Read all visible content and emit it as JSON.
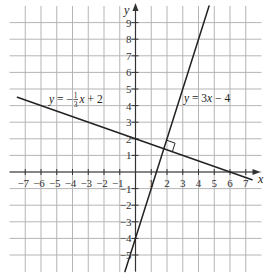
{
  "chart_data": {
    "type": "line",
    "title": "",
    "xlabel": "x",
    "ylabel": "y",
    "xlim": [
      -8,
      8
    ],
    "ylim": [
      -6,
      10
    ],
    "grid": true,
    "legend": "none",
    "x_ticks": {
      "values": [
        -7,
        -6,
        -5,
        -4,
        -3,
        -2,
        -1,
        1,
        2,
        3,
        4,
        5,
        6,
        7
      ],
      "labels": [
        "−7",
        "−6",
        "−5",
        "−4",
        "−3",
        "−2",
        "−1",
        "1",
        "2",
        "3",
        "4",
        "5",
        "6",
        "7"
      ]
    },
    "y_ticks": {
      "values": [
        9,
        8,
        7,
        6,
        5,
        4,
        3,
        2,
        1,
        -1,
        -2,
        -3,
        -4,
        -5
      ],
      "labels": [
        "9",
        "8",
        "7",
        "6",
        "5",
        "4",
        "3",
        "2",
        "1",
        "−1",
        "−2",
        "−3",
        "−4",
        "−5"
      ]
    },
    "series": [
      {
        "name": "y = −(1/3)x + 2",
        "slope": -0.3333,
        "intercept": 2,
        "x": [
          -7.5,
          7.4
        ],
        "y": [
          4.5,
          -0.47
        ],
        "label_runs": [
          {
            "text": "y",
            "italic": true
          },
          {
            "text": " = −",
            "italic": false
          },
          {
            "frac": [
              "1",
              "3"
            ]
          },
          {
            "text": "x",
            "italic": true
          },
          {
            "text": " + 2",
            "italic": false
          }
        ]
      },
      {
        "name": "y = 3x − 4",
        "slope": 3,
        "intercept": -4,
        "x": [
          -0.67,
          4.67
        ],
        "y": [
          -6,
          10
        ],
        "label_runs": [
          {
            "text": "y",
            "italic": true
          },
          {
            "text": " = 3",
            "italic": false
          },
          {
            "text": "x",
            "italic": true
          },
          {
            "text": " − 4",
            "italic": false
          }
        ]
      }
    ],
    "annotations": [
      {
        "type": "right-angle-marker",
        "at": [
          1.8,
          1.4
        ],
        "text": ""
      }
    ],
    "colors": {
      "background": "#ffffff",
      "grid": "#b5b5b5",
      "axis": "#333333",
      "line": "#222222"
    }
  }
}
